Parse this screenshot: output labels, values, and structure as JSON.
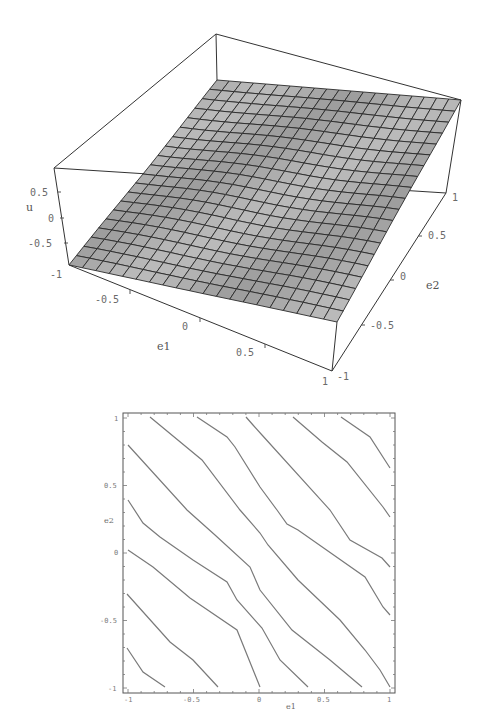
{
  "chart_data": [
    {
      "type": "surface3d",
      "title": "",
      "xlabel": "e1",
      "ylabel": "e2",
      "zlabel": "u",
      "x_ticks": [
        "-0.5",
        "0",
        "0.5",
        "1"
      ],
      "y_ticks": [
        "-1",
        "-0.5",
        "0",
        "0.5",
        "1"
      ],
      "z_ticks": [
        "0.5",
        "0",
        "-0.5",
        "-1"
      ],
      "xlim": [
        -1,
        1
      ],
      "ylim": [
        -1,
        1
      ],
      "zlim": [
        -1,
        1
      ],
      "grid_size": 20,
      "surface_fill": "#b4b4b4",
      "mesh_color": "#2a2a2a",
      "surface_corners": {
        "e1=-1,e2=1": [
          217,
          80
        ],
        "e1=1,e2=1": [
          461,
          100
        ],
        "e1=1,e2=-1": [
          337,
          322
        ],
        "e1=-1,e2=-1": [
          69,
          265
        ]
      },
      "description": "Nearly planar surface u(e1,e2), increasing with e1 and e2, approx u ≈ (e1+e2)/2 with slight ripples"
    },
    {
      "type": "contour",
      "title": "",
      "xlabel": "e1",
      "ylabel": "e2",
      "x_ticks": [
        "-1",
        "-0.5",
        "0",
        "0.5",
        "1"
      ],
      "y_ticks": [
        "1",
        "0.5",
        "e2",
        "0",
        "-0.5",
        "-1"
      ],
      "xlim": [
        -1,
        1
      ],
      "ylim": [
        -1,
        1
      ],
      "line_color": "#7a7a7a",
      "contours_px": [
        [
          [
            127,
            648
          ],
          [
            143,
            672
          ],
          [
            165,
            687
          ]
        ],
        [
          [
            127,
            594
          ],
          [
            170,
            642
          ],
          [
            193,
            660
          ],
          [
            218,
            687
          ]
        ],
        [
          [
            128,
            550
          ],
          [
            153,
            567
          ],
          [
            190,
            598
          ],
          [
            237,
            630
          ],
          [
            260,
            687
          ]
        ],
        [
          [
            128,
            500
          ],
          [
            143,
            523
          ],
          [
            160,
            537
          ],
          [
            193,
            560
          ],
          [
            227,
            582
          ],
          [
            237,
            600
          ],
          [
            262,
            628
          ],
          [
            280,
            660
          ],
          [
            308,
            687
          ]
        ],
        [
          [
            128,
            445
          ],
          [
            187,
            510
          ],
          [
            215,
            535
          ],
          [
            250,
            567
          ],
          [
            260,
            590
          ],
          [
            292,
            630
          ],
          [
            330,
            660
          ],
          [
            362,
            687
          ]
        ],
        [
          [
            150,
            417
          ],
          [
            202,
            460
          ],
          [
            240,
            510
          ],
          [
            260,
            533
          ],
          [
            268,
            545
          ],
          [
            298,
            580
          ],
          [
            340,
            620
          ],
          [
            365,
            650
          ],
          [
            380,
            670
          ],
          [
            390,
            687
          ]
        ],
        [
          [
            197,
            417
          ],
          [
            227,
            437
          ],
          [
            235,
            447
          ],
          [
            260,
            487
          ],
          [
            277,
            510
          ],
          [
            287,
            524
          ],
          [
            298,
            530
          ],
          [
            365,
            577
          ],
          [
            383,
            607
          ],
          [
            390,
            615
          ]
        ],
        [
          [
            246,
            417
          ],
          [
            253,
            425
          ],
          [
            262,
            435
          ],
          [
            330,
            510
          ],
          [
            350,
            540
          ],
          [
            382,
            558
          ],
          [
            390,
            567
          ]
        ],
        [
          [
            293,
            417
          ],
          [
            322,
            442
          ],
          [
            347,
            462
          ],
          [
            383,
            507
          ],
          [
            390,
            517
          ]
        ],
        [
          [
            341,
            417
          ],
          [
            370,
            437
          ],
          [
            390,
            468
          ]
        ]
      ]
    }
  ]
}
